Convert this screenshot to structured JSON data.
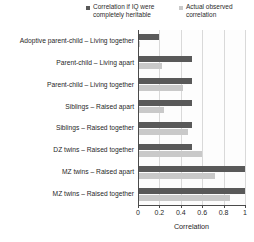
{
  "chart_data": {
    "type": "bar",
    "orientation": "horizontal",
    "title": "",
    "xlabel": "Correlation",
    "ylabel": "",
    "xlim": [
      0,
      1
    ],
    "xticks": [
      "0",
      "0.2",
      "0.4",
      "0.6",
      "0.8",
      "1"
    ],
    "xtick_values": [
      0,
      0.2,
      0.4,
      0.6,
      0.8,
      1
    ],
    "grid": true,
    "legend_position": "top-right",
    "categories": [
      "Adoptive parent-child – Living together",
      "Parent-child – Living apart",
      "Parent-child – Living together",
      "Siblings – Raised apart",
      "Siblings – Raised together",
      "DZ twins – Raised together",
      "MZ twins – Raised apart",
      "MZ twins – Raised together"
    ],
    "series": [
      {
        "name": "Correlation if IQ were completely heritable",
        "color": "#595959",
        "values": [
          0.2,
          0.5,
          0.5,
          0.5,
          0.5,
          0.5,
          1.0,
          1.0
        ]
      },
      {
        "name": "Actual observed correlation",
        "color": "#c9c9c9",
        "values": [
          0.02,
          0.22,
          0.42,
          0.24,
          0.47,
          0.6,
          0.72,
          0.86
        ]
      }
    ]
  },
  "legend": {
    "items": [
      {
        "label": "Correlation if IQ were\ncompletely heritable",
        "color": "#595959",
        "marker": "square-marker"
      },
      {
        "label": "Actual observed\ncorrelation",
        "color": "#c9c9c9",
        "marker": "square-marker"
      }
    ]
  },
  "axis": {
    "x_title": "Correlation"
  }
}
